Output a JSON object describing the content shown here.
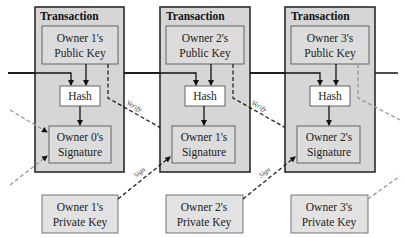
{
  "diagram": {
    "transactions": [
      {
        "title": "Transaction",
        "public_key": [
          "Owner 1's",
          "Public Key"
        ],
        "hash": "Hash",
        "signature": [
          "Owner 0's",
          "Signature"
        ]
      },
      {
        "title": "Transaction",
        "public_key": [
          "Owner 2's",
          "Public Key"
        ],
        "hash": "Hash",
        "signature": [
          "Owner 1's",
          "Signature"
        ]
      },
      {
        "title": "Transaction",
        "public_key": [
          "Owner 3's",
          "Public Key"
        ],
        "hash": "Hash",
        "signature": [
          "Owner 2's",
          "Signature"
        ]
      }
    ],
    "private_keys": [
      [
        "Owner 1's",
        "Private Key"
      ],
      [
        "Owner 2's",
        "Private Key"
      ],
      [
        "Owner 3's",
        "Private Key"
      ]
    ],
    "edge_labels": {
      "verify": "Verify",
      "sign": "Sign"
    },
    "colors": {
      "transaction_fill": "#d6d6d6",
      "inner_fill": "#dcdcdc",
      "hash_fill": "#ffffff",
      "border": "#2a2a2a"
    }
  }
}
